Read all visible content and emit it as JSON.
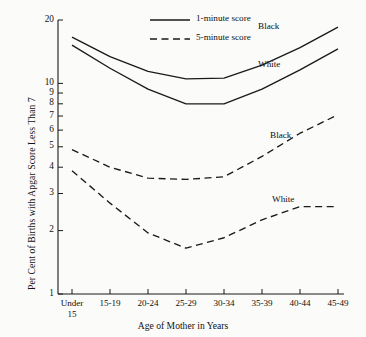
{
  "chart_data": {
    "type": "line",
    "title": "",
    "xlabel": "Age of Mother in Years",
    "ylabel": "Per Cent of Births with Apgar Score Less Than 7",
    "categories": [
      "Under 15",
      "15-19",
      "20-24",
      "25-29",
      "30-34",
      "35-39",
      "40-44",
      "45-49"
    ],
    "yscale": "log",
    "ylim": [
      1,
      20
    ],
    "yticks": [
      1,
      2,
      3,
      4,
      5,
      6,
      7,
      8,
      9,
      10,
      20
    ],
    "ytick_labels": [
      "1",
      "2",
      "3",
      "4",
      "5",
      "6",
      "7",
      "8",
      "9",
      "10",
      "20"
    ],
    "grid": false,
    "legend_position": "top-center",
    "series": [
      {
        "name": "Black, 1-minute score",
        "race": "Black",
        "score": "1-minute score",
        "style": "solid",
        "values": [
          16.6,
          13.4,
          11.4,
          10.5,
          10.6,
          12.2,
          14.8,
          18.5
        ]
      },
      {
        "name": "White, 1-minute score",
        "race": "White",
        "score": "1-minute score",
        "style": "solid",
        "values": [
          15.2,
          11.8,
          9.4,
          8.0,
          8.0,
          9.4,
          11.6,
          14.6
        ]
      },
      {
        "name": "Black, 5-minute score",
        "race": "Black",
        "score": "5-minute score",
        "style": "dashed",
        "values": [
          4.85,
          4.0,
          3.55,
          3.5,
          3.6,
          4.5,
          5.8,
          7.1
        ]
      },
      {
        "name": "White, 5-minute score",
        "race": "White",
        "score": "5-minute score",
        "style": "dashed",
        "values": [
          3.85,
          2.7,
          1.95,
          1.65,
          1.85,
          2.25,
          2.6,
          2.6
        ]
      }
    ],
    "legend": [
      {
        "label": "1-minute score",
        "style": "solid"
      },
      {
        "label": "5-minute score",
        "style": "dashed"
      }
    ],
    "annotations": [
      {
        "text": "Black",
        "series": "Black, 1-minute score"
      },
      {
        "text": "White",
        "series": "White, 1-minute score"
      },
      {
        "text": "Black",
        "series": "Black, 5-minute score"
      },
      {
        "text": "White",
        "series": "White, 5-minute score"
      }
    ],
    "line_color": "#1a1a1a"
  }
}
